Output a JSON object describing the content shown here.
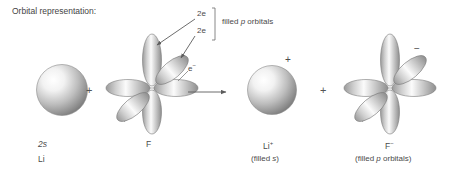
{
  "figure": {
    "caption": "Orbital representation:",
    "type": "chemistry-orbital-diagram",
    "colors": {
      "ink": "#4a4a4a",
      "line": "#7a7a7a",
      "orbital_light": "#ffffff",
      "orbital_dark": "#6e6e6e",
      "sphere_highlight": "#ffffff",
      "sphere_shadow": "#5a5a5a"
    }
  },
  "annotations": {
    "electron_count_top": "2e",
    "electron_count_bottom": "2e",
    "filled_p_orbitals": "filled p orbitals",
    "filled_p_italic": "p",
    "electron_label": "e",
    "electron_charge": "−",
    "li_ion_charge": "+",
    "f_ion_charge": "−"
  },
  "operators": {
    "plus_left": "+",
    "plus_right": "+",
    "arrow": "→"
  },
  "species": [
    {
      "id": "lithium",
      "shape": "sphere",
      "orbital_label": "2s",
      "orbital_label_italic": true,
      "element_label": "Li",
      "sublabel": ""
    },
    {
      "id": "fluorine",
      "shape": "p-orbital-cluster",
      "orbital_label": "",
      "element_label": "F",
      "sublabel": ""
    },
    {
      "id": "lithium-ion",
      "shape": "sphere",
      "orbital_label": "",
      "element_label": "Li",
      "charge": "+",
      "sublabel": "(filled s)",
      "sublabel_italic_part": "s"
    },
    {
      "id": "fluoride-ion",
      "shape": "p-orbital-cluster",
      "orbital_label": "",
      "element_label": "F",
      "charge": "−",
      "sublabel": "(filled p orbitals)",
      "sublabel_italic_part": "p"
    }
  ]
}
